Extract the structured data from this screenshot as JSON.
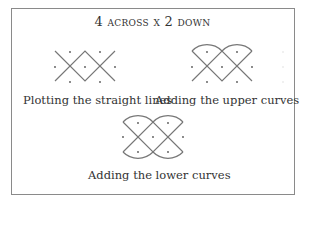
{
  "title": "4 across x 2 down",
  "panels": [
    {
      "id": "straight",
      "caption": "Plotting the straight lines"
    },
    {
      "id": "upper",
      "caption": "Adding the upper curves"
    },
    {
      "id": "lower",
      "caption": "Adding the lower curves"
    }
  ],
  "grid": {
    "across": 4,
    "down": 2
  },
  "colors": {
    "line": "#777777",
    "dot": "#555555",
    "border": "#8a8a8a"
  }
}
